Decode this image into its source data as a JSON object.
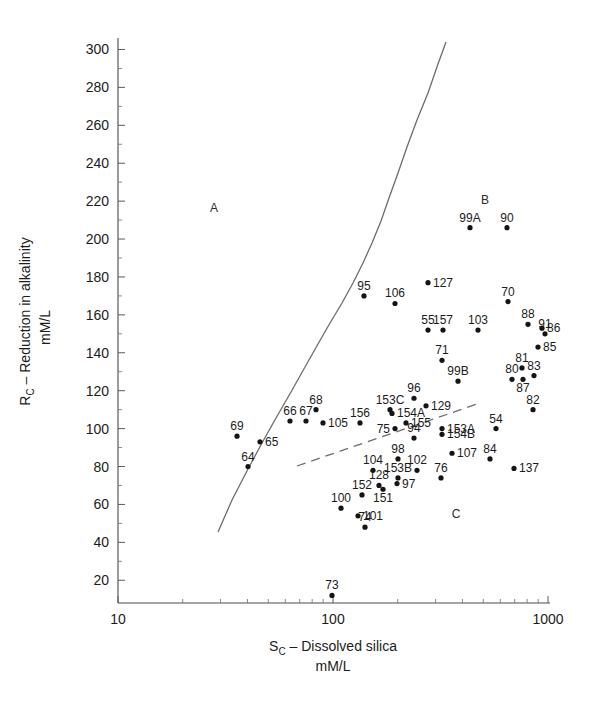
{
  "chart_data": {
    "type": "scatter",
    "title": "",
    "xlabel": "S_C – Dissolved silica",
    "xlabel_main": "S",
    "xlabel_sub": "C",
    "xlabel_rest": " – Dissolved silica",
    "xlabel_units": "mM/L",
    "ylabel_main": "R",
    "ylabel_sub": "C",
    "ylabel_rest": " – Reduction in alkalinity",
    "ylabel_units": "mM/L",
    "xscale": "log",
    "yscale": "linear",
    "xlim": [
      10,
      1000
    ],
    "ylim": [
      8,
      305
    ],
    "grid": false,
    "legend": "none",
    "x_ticks": [
      {
        "value": 10,
        "label": "10"
      },
      {
        "value": 100,
        "label": "100"
      },
      {
        "value": 1000,
        "label": "1000"
      }
    ],
    "y_ticks": [
      {
        "value": 300,
        "label": "300"
      },
      {
        "value": 280,
        "label": "280"
      },
      {
        "value": 260,
        "label": "260"
      },
      {
        "value": 240,
        "label": "240"
      },
      {
        "value": 220,
        "label": "220"
      },
      {
        "value": 200,
        "label": "200"
      },
      {
        "value": 180,
        "label": "180"
      },
      {
        "value": 160,
        "label": "160"
      },
      {
        "value": 140,
        "label": "140"
      },
      {
        "value": 120,
        "label": "120"
      },
      {
        "value": 100,
        "label": "100"
      },
      {
        "value": 80,
        "label": "80"
      },
      {
        "value": 60,
        "label": "60"
      },
      {
        "value": 40,
        "label": "40"
      },
      {
        "value": 20,
        "label": "20"
      }
    ],
    "region_labels": [
      {
        "text": "A",
        "x_px": 214,
        "y_px": 212
      },
      {
        "text": "B",
        "x_px": 485,
        "y_px": 204
      },
      {
        "text": "C",
        "x_px": 456,
        "y_px": 518
      }
    ],
    "boundaries": [
      {
        "name": "solid-boundary-curve",
        "style": "solid",
        "points_px": [
          [
            218,
            532
          ],
          [
            232,
            500
          ],
          [
            248,
            469
          ],
          [
            262,
            443
          ],
          [
            276,
            418
          ],
          [
            291,
            392
          ],
          [
            305,
            367
          ],
          [
            318,
            344
          ],
          [
            330,
            323
          ],
          [
            342,
            303
          ],
          [
            353,
            283
          ],
          [
            363,
            263
          ],
          [
            372,
            243
          ],
          [
            381,
            221
          ],
          [
            389,
            198
          ],
          [
            398,
            173
          ],
          [
            407,
            147
          ],
          [
            417,
            120
          ],
          [
            428,
            93
          ],
          [
            438,
            64
          ],
          [
            446,
            42
          ]
        ]
      },
      {
        "name": "dashed-boundary-line",
        "style": "dashed",
        "points_px": [
          [
            297,
            466
          ],
          [
            480,
            403
          ]
        ]
      }
    ],
    "points": [
      {
        "label": "107",
        "x_px": 452,
        "y_px": 87,
        "lx": 461,
        "ly": 80,
        "lpos": "right"
      },
      {
        "label": "91",
        "x_px": 545,
        "y_px": 150,
        "lx": 545,
        "ly": 142,
        "lpos": "above"
      },
      {
        "label": "70",
        "x_px": 508,
        "y_px": 167,
        "lx": 508,
        "ly": 159,
        "lpos": "above"
      },
      {
        "label": "99A",
        "x_px": 470,
        "y_px": 206,
        "lx": 470,
        "ly": 198,
        "lpos": "above"
      },
      {
        "label": "90",
        "x_px": 507,
        "y_px": 206,
        "lx": 507,
        "ly": 198,
        "lpos": "above"
      },
      {
        "label": "127",
        "x_px": 428,
        "y_px": 177,
        "lx": 435,
        "ly": 180,
        "lpos": "right"
      },
      {
        "label": "95",
        "x_px": 364,
        "y_px": 170,
        "lx": 364,
        "ly": 162,
        "lpos": "above"
      },
      {
        "label": "106",
        "x_px": 395,
        "y_px": 166,
        "lx": 397,
        "ly": 158,
        "lpos": "above"
      },
      {
        "label": "55",
        "x_px": 428,
        "y_px": 152,
        "lx": 428,
        "ly": 144,
        "lpos": "above"
      },
      {
        "label": "157",
        "x_px": 443,
        "y_px": 152,
        "lx": 445,
        "ly": 144,
        "lpos": "above"
      },
      {
        "label": "103",
        "x_px": 478,
        "y_px": 152,
        "lx": 478,
        "ly": 144,
        "lpos": "above"
      },
      {
        "label": "88",
        "x_px": 528,
        "y_px": 155,
        "lx": 528,
        "ly": 147,
        "lpos": "above"
      },
      {
        "label": "86",
        "x_px": 542,
        "y_px": 153,
        "lx": 549,
        "ly": 156,
        "lpos": "right"
      },
      {
        "label": "85",
        "x_px": 538,
        "y_px": 143,
        "lx": 545,
        "ly": 146,
        "lpos": "right"
      },
      {
        "label": "71",
        "x_px": 442,
        "y_px": 136,
        "lx": 442,
        "ly": 128,
        "lpos": "above"
      },
      {
        "label": "81",
        "x_px": 522,
        "y_px": 132,
        "lx": 521,
        "ly": 126,
        "lpos": "above"
      },
      {
        "label": "83",
        "x_px": 534,
        "y_px": 128,
        "lx": 535,
        "ly": 122,
        "lpos": "above"
      },
      {
        "label": "80",
        "x_px": 512,
        "y_px": 126,
        "lx": 509,
        "ly": 121,
        "lpos": "above"
      },
      {
        "label": "87",
        "x_px": 523,
        "y_px": 126,
        "lx": 525,
        "ly": 133,
        "lpos": "below"
      },
      {
        "label": "99B",
        "x_px": 458,
        "y_px": 125,
        "lx": 458,
        "ly": 117,
        "lpos": "above"
      },
      {
        "label": "96",
        "x_px": 414,
        "y_px": 116,
        "lx": 414,
        "ly": 108,
        "lpos": "above"
      },
      {
        "label": "129",
        "x_px": 426,
        "y_px": 112,
        "lx": 433,
        "ly": 115,
        "lpos": "right"
      },
      {
        "label": "82",
        "x_px": 533,
        "y_px": 110,
        "lx": 532,
        "ly": 103,
        "lpos": "above"
      },
      {
        "label": "153C",
        "x_px": 390,
        "y_px": 110,
        "lx": 389,
        "ly": 103,
        "lpos": "above"
      },
      {
        "label": "154A",
        "x_px": 392,
        "y_px": 108,
        "lx": 400,
        "ly": 111,
        "lpos": "right"
      },
      {
        "label": "68",
        "x_px": 316,
        "y_px": 110,
        "lx": 316,
        "ly": 102,
        "lpos": "above"
      },
      {
        "label": "66",
        "x_px": 290,
        "y_px": 104,
        "lx": 289,
        "ly": 97,
        "lpos": "above"
      },
      {
        "label": "67",
        "x_px": 306,
        "y_px": 104,
        "lx": 305,
        "ly": 97,
        "lpos": "above"
      },
      {
        "label": "105",
        "x_px": 323,
        "y_px": 103,
        "lx": 330,
        "ly": 101,
        "lpos": "right"
      },
      {
        "label": "156",
        "x_px": 360,
        "y_px": 103,
        "lx": 360,
        "ly": 96,
        "lpos": "above"
      },
      {
        "label": "155",
        "x_px": 406,
        "y_px": 103,
        "lx": 412,
        "ly": 104,
        "lpos": "right"
      },
      {
        "label": "75",
        "x_px": 395,
        "y_px": 100,
        "lx": 386,
        "ly": 101,
        "lpos": "left"
      },
      {
        "label": "153A",
        "x_px": 442,
        "y_px": 100,
        "lx": 448,
        "ly": 101,
        "lpos": "right"
      },
      {
        "label": "154B",
        "x_px": 442,
        "y_px": 97,
        "lx": 448,
        "ly": 93,
        "lpos": "right"
      },
      {
        "label": "54",
        "x_px": 496,
        "y_px": 100,
        "lx": 495,
        "ly": 106,
        "lpos": "above"
      },
      {
        "label": "94",
        "x_px": 414,
        "y_px": 95,
        "lx": 416,
        "ly": 102,
        "lpos": "above"
      },
      {
        "label": "69",
        "x_px": 237,
        "y_px": 96,
        "lx": 237,
        "ly": 89,
        "lpos": "above"
      },
      {
        "label": "65",
        "x_px": 260,
        "y_px": 93,
        "lx": 267,
        "ly": 92,
        "lpos": "right"
      },
      {
        "label": "98",
        "x_px": 398,
        "y_px": 84,
        "lx": 396,
        "ly": 91,
        "lpos": "above"
      },
      {
        "label": "64",
        "x_px": 248,
        "y_px": 80,
        "lx": 246,
        "ly": 87,
        "lpos": "above"
      },
      {
        "label": "84",
        "x_px": 490,
        "y_px": 84,
        "lx": 490,
        "ly": 90,
        "lpos": "above"
      },
      {
        "label": "137",
        "x_px": 514,
        "y_px": 79,
        "lx": 521,
        "ly": 79,
        "lpos": "right"
      },
      {
        "label": "104",
        "x_px": 373,
        "y_px": 78,
        "lx": 373,
        "ly": 85,
        "lpos": "above"
      },
      {
        "label": "102",
        "x_px": 417,
        "y_px": 78,
        "lx": 418,
        "ly": 85,
        "lpos": "above"
      },
      {
        "label": "76",
        "x_px": 441,
        "y_px": 74,
        "lx": 440,
        "ly": 81,
        "lpos": "above"
      },
      {
        "label": "153B",
        "x_px": 398,
        "y_px": 74,
        "lx": 396,
        "ly": 79,
        "lpos": "above"
      },
      {
        "label": "97",
        "x_px": 397,
        "y_px": 71,
        "lx": 404,
        "ly": 70,
        "lpos": "right"
      },
      {
        "label": "128",
        "x_px": 379,
        "y_px": 70,
        "lx": 378,
        "ly": 76,
        "lpos": "above"
      },
      {
        "label": "151",
        "x_px": 383,
        "y_px": 68,
        "lx": 385,
        "ly": 63,
        "lpos": "below"
      },
      {
        "label": "152",
        "x_px": 362,
        "y_px": 65,
        "lx": 360,
        "ly": 71,
        "lpos": "above"
      },
      {
        "label": "100",
        "x_px": 341,
        "y_px": 58,
        "lx": 339,
        "ly": 65,
        "lpos": "above"
      },
      {
        "label": "101",
        "x_px": 358,
        "y_px": 54,
        "lx": 365,
        "ly": 54,
        "lpos": "right"
      },
      {
        "label": "74",
        "x_px": 365,
        "y_px": 48,
        "lx": 365,
        "ly": 55,
        "lpos": "above"
      },
      {
        "label": "73",
        "x_px": 332,
        "y_px": 12,
        "lx": 332,
        "ly": 19,
        "lpos": "above"
      }
    ]
  },
  "geometry": {
    "plot_left_px": 118,
    "plot_right_px": 548,
    "plot_bottom_px": 603,
    "plot_top_px": 40
  }
}
